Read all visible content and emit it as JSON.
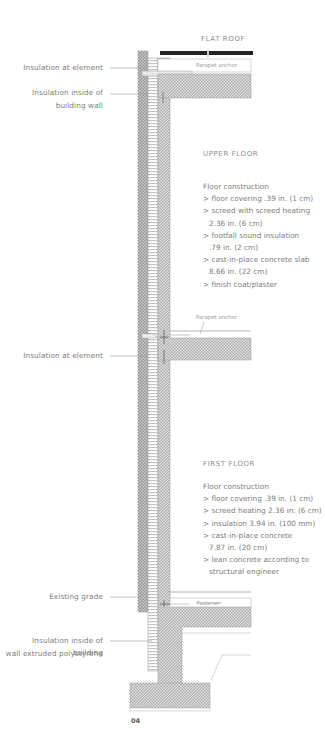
{
  "diagram": {
    "figure_number": "04",
    "roof": {
      "heading": "FLAT ROOF",
      "anchor_label": "Parapet anchor"
    },
    "upper_floor": {
      "heading": "UPPER FLOOR",
      "construction_title": "Floor construction",
      "items": [
        "> floor covering .39 in. (1 cm)",
        "> screed with screed heating",
        "2.36 in. (6 cm)",
        "> footfall sound insulation",
        ".79 in. (2 cm)",
        "> cast-in-place concrete slab",
        "8.66 in. (22 cm)",
        "> finish coat/plaster"
      ],
      "anchor_label": "Parapet anchor"
    },
    "first_floor": {
      "heading": "FIRST FLOOR",
      "construction_title": "Floor construction",
      "items": [
        "> floor covering .39 in. (1 cm)",
        "> screed heating 2.36 in. (6 cm)",
        "> insulation 3.94 in. (100 mm)",
        "> cast-in-place concrete",
        "7.87 in. (20 cm)",
        "> lean concrete according to",
        "structural engineer"
      ],
      "fastener_label": "Fastener"
    },
    "left_labels": {
      "insulation_at_element_top": "Insulation at element",
      "insulation_inside_wall_1": "Insulation inside of",
      "insulation_inside_wall_2": "building wall",
      "insulation_at_element_mid": "Insulation at element",
      "existing_grade": "Existing grade",
      "insulation_xps_1": "Insulation inside of building",
      "insulation_xps_2": "wall extruded polystyrene"
    },
    "colors": {
      "line": "#9a9a9a",
      "hatch": "#b8b8b8",
      "roof_membrane": "#222222",
      "text": "#7d7d7d"
    }
  }
}
